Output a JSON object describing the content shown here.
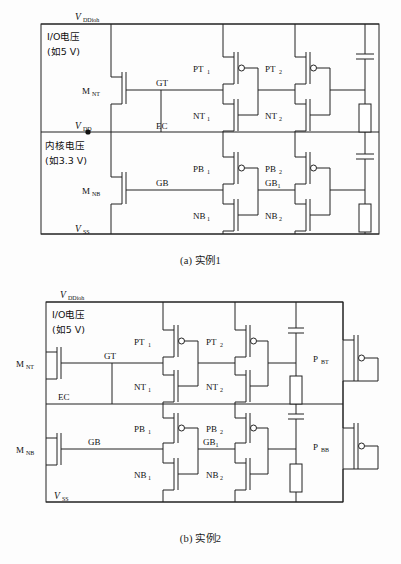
{
  "figure": {
    "title_a": "(a) 实例1",
    "title_b": "(b) 实例2"
  },
  "circuit_a": {
    "rails": [
      {
        "name": "vddioh",
        "symbol": "V",
        "subscript": "DDioh",
        "desc_line1": "I/O电压",
        "desc_line2": "(如5 V)"
      },
      {
        "name": "vdd",
        "symbol": "V",
        "subscript": "DD",
        "desc_line1": "内核电压",
        "desc_line2": "(如3.3 V)"
      },
      {
        "name": "vss",
        "symbol": "V",
        "subscript": "SS",
        "desc_line1": "",
        "desc_line2": ""
      }
    ],
    "nets": [
      {
        "name": "gt",
        "label": "GT"
      },
      {
        "name": "ec",
        "label": "EC"
      },
      {
        "name": "gb",
        "label": "GB"
      },
      {
        "name": "gb1",
        "label": "GB",
        "sub": "1"
      }
    ],
    "devices": [
      {
        "name": "mnt",
        "label": "M",
        "sub": "NT",
        "type": "nmos"
      },
      {
        "name": "mnb",
        "label": "M",
        "sub": "NB",
        "type": "nmos"
      },
      {
        "name": "pt1",
        "label": "PT",
        "sub": "1",
        "type": "pmos"
      },
      {
        "name": "pt2",
        "label": "PT",
        "sub": "2",
        "type": "pmos"
      },
      {
        "name": "nt1",
        "label": "NT",
        "sub": "1",
        "type": "nmos"
      },
      {
        "name": "nt2",
        "label": "NT",
        "sub": "2",
        "type": "nmos"
      },
      {
        "name": "pb1",
        "label": "PB",
        "sub": "1",
        "type": "pmos"
      },
      {
        "name": "pb2",
        "label": "PB",
        "sub": "2",
        "type": "pmos"
      },
      {
        "name": "nb1",
        "label": "NB",
        "sub": "1",
        "type": "nmos"
      },
      {
        "name": "nb2",
        "label": "NB",
        "sub": "2",
        "type": "nmos"
      }
    ],
    "passives": [
      {
        "name": "cap-top",
        "kind": "capacitor"
      },
      {
        "name": "res-top",
        "kind": "resistor"
      },
      {
        "name": "cap-bot",
        "kind": "capacitor"
      },
      {
        "name": "res-bot",
        "kind": "resistor"
      }
    ]
  },
  "circuit_b": {
    "rails": [
      {
        "name": "vddioh",
        "symbol": "V",
        "subscript": "DDioh",
        "desc_line1": "I/O电压",
        "desc_line2": "(如5 V)"
      },
      {
        "name": "vss",
        "symbol": "V",
        "subscript": "SS",
        "desc_line1": "",
        "desc_line2": ""
      }
    ],
    "nets": [
      {
        "name": "gt",
        "label": "GT"
      },
      {
        "name": "ec",
        "label": "EC"
      },
      {
        "name": "gb",
        "label": "GB"
      },
      {
        "name": "gb1",
        "label": "GB",
        "sub": "1"
      }
    ],
    "devices": [
      {
        "name": "mnt",
        "label": "M",
        "sub": "NT",
        "type": "nmos"
      },
      {
        "name": "mnb",
        "label": "M",
        "sub": "NB",
        "type": "nmos"
      },
      {
        "name": "pt1",
        "label": "PT",
        "sub": "1",
        "type": "pmos"
      },
      {
        "name": "pt2",
        "label": "PT",
        "sub": "2",
        "type": "pmos"
      },
      {
        "name": "nt1",
        "label": "NT",
        "sub": "1",
        "type": "nmos"
      },
      {
        "name": "nt2",
        "label": "NT",
        "sub": "2",
        "type": "nmos"
      },
      {
        "name": "pb1",
        "label": "PB",
        "sub": "1",
        "type": "pmos"
      },
      {
        "name": "pb2",
        "label": "PB",
        "sub": "2",
        "type": "pmos"
      },
      {
        "name": "nb1",
        "label": "NB",
        "sub": "1",
        "type": "nmos"
      },
      {
        "name": "nb2",
        "label": "NB",
        "sub": "2",
        "type": "nmos"
      },
      {
        "name": "pbt",
        "label": "P",
        "sub": "BT",
        "type": "pmos"
      },
      {
        "name": "pbb",
        "label": "P",
        "sub": "BB",
        "type": "pmos"
      }
    ],
    "passives": [
      {
        "name": "cap-top",
        "kind": "capacitor"
      },
      {
        "name": "res-top",
        "kind": "resistor"
      },
      {
        "name": "cap-bot",
        "kind": "capacitor"
      },
      {
        "name": "res-bot",
        "kind": "resistor"
      }
    ]
  },
  "colors": {
    "ink": "#222222",
    "paper": "#fdfdfd"
  }
}
